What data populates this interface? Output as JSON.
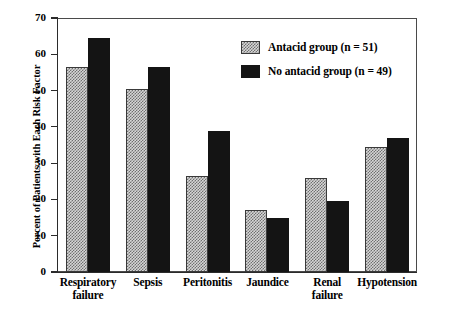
{
  "chart_data": {
    "type": "bar",
    "title": "",
    "xlabel": "",
    "ylabel": "Percent of Patients with Each Risk Factor",
    "ylim": [
      0,
      70
    ],
    "yticks": [
      0,
      10,
      20,
      30,
      40,
      50,
      60,
      70
    ],
    "ytick_labels": [
      "0",
      "10",
      "20",
      "30",
      "40",
      "50",
      "60",
      "70"
    ],
    "grid": false,
    "legend_position": "top-right",
    "categories": [
      "Respiratory failure",
      "Sepsis",
      "Peritonitis",
      "Jaundice",
      "Renal failure",
      "Hypotension"
    ],
    "category_lines": [
      [
        "Respiratory",
        "failure"
      ],
      [
        "Sepsis",
        ""
      ],
      [
        "Peritonitis",
        ""
      ],
      [
        "Jaundice",
        ""
      ],
      [
        "Renal",
        "failure"
      ],
      [
        "Hypotension",
        ""
      ]
    ],
    "series": [
      {
        "name": "Antacid group (n = 51)",
        "color": "#d6d6d6",
        "pattern": "checkered",
        "values": [
          56.5,
          50.5,
          26.5,
          17,
          26,
          34.5
        ]
      },
      {
        "name": "No antacid group (n = 49)",
        "color": "#141414",
        "pattern": "solid",
        "values": [
          64.5,
          56.5,
          39,
          15,
          19.5,
          37
        ]
      }
    ]
  },
  "legend": {
    "items": [
      {
        "label": "Antacid group (n = 51)",
        "swatch": "checkered-gray"
      },
      {
        "label": "No antacid group (n = 49)",
        "swatch": "solid-black"
      }
    ]
  },
  "axes": {
    "y_title": "Percent of Patients with Each Risk Factor"
  }
}
